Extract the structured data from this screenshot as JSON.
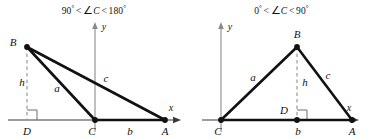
{
  "figure": {
    "panels": [
      {
        "id": "obtuse",
        "title": {
          "left_value": "90",
          "degree": "°",
          "relation_left": "<",
          "angle_symbol": "∠",
          "vertex": "C",
          "relation_right": "<",
          "right_value": "180",
          "full_text": "90° < ∠C < 180°"
        },
        "axes": {
          "x_label": "x",
          "y_label": "y"
        },
        "vertices": {
          "A": "A",
          "B": "B",
          "C": "C",
          "D": "D"
        },
        "sides": {
          "a": "a",
          "b": "b",
          "c": "c",
          "h": "h"
        }
      },
      {
        "id": "acute",
        "title": {
          "left_value": "0",
          "degree": "°",
          "relation_left": "<",
          "angle_symbol": "∠",
          "vertex": "C",
          "relation_right": "<",
          "right_value": "90",
          "full_text": "0° < ∠C < 90°"
        },
        "axes": {
          "x_label": "x",
          "y_label": "y"
        },
        "vertices": {
          "A": "A",
          "B": "B",
          "C": "C",
          "D": "D"
        },
        "sides": {
          "a": "a",
          "b": "b",
          "c": "c",
          "h": "h"
        }
      }
    ],
    "colors": {
      "background": "#ffffff",
      "stroke": "#111111",
      "axis": "#8a8a8a",
      "dashed": "#9a9a9a"
    }
  }
}
